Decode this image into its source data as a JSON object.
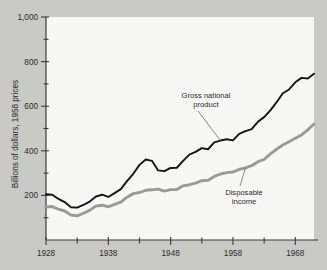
{
  "chart_data": {
    "type": "line",
    "title": "",
    "xlabel": "",
    "ylabel": "Billions of dollars, 1958 prices",
    "xlim": [
      1928,
      1971
    ],
    "ylim": [
      0,
      1000
    ],
    "grid": false,
    "legend_position": "inline-annotations",
    "y_ticks_major": [
      "200",
      "400",
      "600",
      "800",
      "1,000"
    ],
    "y_ticks_major_values": [
      200,
      400,
      600,
      800,
      1000
    ],
    "y_ticks_minor_values": [
      100,
      300,
      500,
      700,
      900
    ],
    "x_ticks_major": [
      "1928",
      "1938",
      "1948",
      "1958",
      "1968"
    ],
    "x_ticks_major_values": [
      1928,
      1938,
      1948,
      1958,
      1968
    ],
    "x_ticks_minor_values": [
      1933,
      1943,
      1953,
      1963
    ],
    "x": [
      1928,
      1929,
      1930,
      1931,
      1932,
      1933,
      1934,
      1935,
      1936,
      1937,
      1938,
      1939,
      1940,
      1941,
      1942,
      1943,
      1944,
      1945,
      1946,
      1947,
      1948,
      1949,
      1950,
      1951,
      1952,
      1953,
      1954,
      1955,
      1956,
      1957,
      1958,
      1959,
      1960,
      1961,
      1962,
      1963,
      1964,
      1965,
      1966,
      1967,
      1968,
      1969,
      1970,
      1971
    ],
    "series": [
      {
        "name": "Gross national product",
        "color": "#141414",
        "values": [
          205,
          203,
          184,
          170,
          147,
          145,
          157,
          172,
          195,
          203,
          193,
          210,
          228,
          264,
          297,
          337,
          361,
          355,
          312,
          309,
          323,
          324,
          355,
          383,
          395,
          412,
          407,
          438,
          446,
          452,
          447,
          476,
          488,
          497,
          530,
          551,
          581,
          618,
          658,
          675,
          707,
          727,
          724,
          746
        ],
        "annotation": {
          "text_line1": "Gross national",
          "text_line2": "product",
          "points_to_year": 1956,
          "points_to_value": 446
        }
      },
      {
        "name": "Disposable income",
        "color": "#9a9a9a",
        "values": [
          148,
          150,
          138,
          130,
          112,
          108,
          120,
          133,
          152,
          156,
          149,
          160,
          170,
          192,
          208,
          213,
          223,
          225,
          228,
          219,
          226,
          226,
          243,
          248,
          255,
          266,
          268,
          285,
          296,
          302,
          305,
          317,
          323,
          333,
          351,
          361,
          386,
          407,
          426,
          441,
          456,
          471,
          494,
          520
        ],
        "annotation": {
          "text_line1": "Disposable",
          "text_line2": "income",
          "points_to_year": 1960,
          "points_to_value": 323
        }
      }
    ]
  },
  "colors": {
    "page_background": "#c9c9c6",
    "plot_background": "#f7f7f5",
    "axis": "#3a3a3a",
    "text": "#2b2b2b",
    "gnp_line": "#141414",
    "disposable_line": "#9a9a9a",
    "leader_line": "#6b6b6b"
  }
}
